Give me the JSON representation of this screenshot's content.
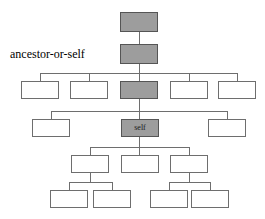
{
  "diagram": {
    "annotation": {
      "text": "ancestor-or-self",
      "x": 10,
      "y": 48
    },
    "colors": {
      "shaded_fill": "#9d9d9d",
      "plain_fill": "#ffffff",
      "border": "#6e6e6e",
      "shaded_border": "#555555",
      "edge": "#6e6e6e",
      "background": "#ffffff",
      "text": "#000000"
    },
    "legend": {
      "shaded_meaning": "ancestor-or-self",
      "self_node_label": "self"
    },
    "nodes": [
      {
        "id": "n1",
        "label": "",
        "shaded": true,
        "x": 120,
        "y": 12,
        "w": 38,
        "h": 20,
        "level": 1
      },
      {
        "id": "n2",
        "label": "",
        "shaded": true,
        "x": 120,
        "y": 44,
        "w": 38,
        "h": 20,
        "level": 2
      },
      {
        "id": "n3a",
        "label": "",
        "shaded": false,
        "x": 21,
        "y": 81,
        "w": 38,
        "h": 18,
        "level": 3
      },
      {
        "id": "n3b",
        "label": "",
        "shaded": false,
        "x": 70,
        "y": 81,
        "w": 38,
        "h": 18,
        "level": 3
      },
      {
        "id": "n3c",
        "label": "",
        "shaded": true,
        "x": 120,
        "y": 81,
        "w": 38,
        "h": 18,
        "level": 3
      },
      {
        "id": "n3d",
        "label": "",
        "shaded": false,
        "x": 170,
        "y": 81,
        "w": 38,
        "h": 18,
        "level": 3
      },
      {
        "id": "n3e",
        "label": "",
        "shaded": false,
        "x": 218,
        "y": 81,
        "w": 38,
        "h": 18,
        "level": 3
      },
      {
        "id": "n4a",
        "label": "",
        "shaded": false,
        "x": 32,
        "y": 119,
        "w": 38,
        "h": 18,
        "level": 4
      },
      {
        "id": "n4b",
        "label": "self",
        "shaded": true,
        "x": 121,
        "y": 119,
        "w": 38,
        "h": 18,
        "level": 4
      },
      {
        "id": "n4c",
        "label": "",
        "shaded": false,
        "x": 208,
        "y": 119,
        "w": 38,
        "h": 18,
        "level": 4
      },
      {
        "id": "n5a",
        "label": "",
        "shaded": false,
        "x": 71,
        "y": 155,
        "w": 38,
        "h": 18,
        "level": 5
      },
      {
        "id": "n5b",
        "label": "",
        "shaded": false,
        "x": 121,
        "y": 155,
        "w": 38,
        "h": 18,
        "level": 5
      },
      {
        "id": "n5c",
        "label": "",
        "shaded": false,
        "x": 170,
        "y": 155,
        "w": 38,
        "h": 18,
        "level": 5
      },
      {
        "id": "n6a",
        "label": "",
        "shaded": false,
        "x": 50,
        "y": 190,
        "w": 38,
        "h": 18,
        "level": 6
      },
      {
        "id": "n6b",
        "label": "",
        "shaded": false,
        "x": 93,
        "y": 190,
        "w": 38,
        "h": 18,
        "level": 6
      },
      {
        "id": "n6c",
        "label": "",
        "shaded": false,
        "x": 150,
        "y": 190,
        "w": 38,
        "h": 18,
        "level": 6
      },
      {
        "id": "n6d",
        "label": "",
        "shaded": false,
        "x": 191,
        "y": 190,
        "w": 38,
        "h": 18,
        "level": 6
      }
    ],
    "edges": [
      {
        "id": "e1",
        "orient": "v",
        "x": 139,
        "y": 32,
        "len": 12,
        "desc": "root-to-level2"
      },
      {
        "id": "e2",
        "orient": "v",
        "x": 139,
        "y": 64,
        "len": 17,
        "desc": "level2-to-bus3"
      },
      {
        "id": "e3",
        "orient": "h",
        "x": 40,
        "y": 73,
        "len": 198,
        "desc": "level3-bus"
      },
      {
        "id": "e4",
        "orient": "v",
        "x": 40,
        "y": 73,
        "len": 8,
        "desc": "drop-to-n3a"
      },
      {
        "id": "e5",
        "orient": "v",
        "x": 89,
        "y": 73,
        "len": 8,
        "desc": "drop-to-n3b"
      },
      {
        "id": "e6",
        "orient": "v",
        "x": 139,
        "y": 73,
        "len": 8,
        "desc": "drop-to-n3c"
      },
      {
        "id": "e7",
        "orient": "v",
        "x": 189,
        "y": 73,
        "len": 8,
        "desc": "drop-to-n3d"
      },
      {
        "id": "e8",
        "orient": "v",
        "x": 237,
        "y": 73,
        "len": 8,
        "desc": "drop-to-n3e"
      },
      {
        "id": "e9",
        "orient": "v",
        "x": 139,
        "y": 99,
        "len": 12,
        "desc": "n3c-to-bus4"
      },
      {
        "id": "e10",
        "orient": "h",
        "x": 51,
        "y": 111,
        "len": 176,
        "desc": "level4-bus"
      },
      {
        "id": "e11",
        "orient": "v",
        "x": 51,
        "y": 111,
        "len": 8,
        "desc": "drop-to-n4a"
      },
      {
        "id": "e12",
        "orient": "v",
        "x": 139,
        "y": 111,
        "len": 8,
        "desc": "drop-to-self"
      },
      {
        "id": "e13",
        "orient": "v",
        "x": 227,
        "y": 111,
        "len": 8,
        "desc": "drop-to-n4c"
      },
      {
        "id": "e14",
        "orient": "v",
        "x": 139,
        "y": 137,
        "len": 10,
        "desc": "self-to-bus5"
      },
      {
        "id": "e15",
        "orient": "h",
        "x": 90,
        "y": 147,
        "len": 99,
        "desc": "level5-bus"
      },
      {
        "id": "e16",
        "orient": "v",
        "x": 90,
        "y": 147,
        "len": 8,
        "desc": "drop-to-n5a"
      },
      {
        "id": "e17",
        "orient": "v",
        "x": 139,
        "y": 147,
        "len": 8,
        "desc": "drop-to-n5b"
      },
      {
        "id": "e18",
        "orient": "v",
        "x": 189,
        "y": 147,
        "len": 8,
        "desc": "drop-to-n5c"
      },
      {
        "id": "e19",
        "orient": "v",
        "x": 90,
        "y": 173,
        "len": 9,
        "desc": "n5a-to-bus6-left"
      },
      {
        "id": "e20",
        "orient": "h",
        "x": 69,
        "y": 182,
        "len": 43,
        "desc": "level6-bus-left"
      },
      {
        "id": "e21",
        "orient": "v",
        "x": 69,
        "y": 182,
        "len": 8,
        "desc": "drop-to-n6a"
      },
      {
        "id": "e22",
        "orient": "v",
        "x": 112,
        "y": 182,
        "len": 8,
        "desc": "drop-to-n6b"
      },
      {
        "id": "e23",
        "orient": "v",
        "x": 189,
        "y": 173,
        "len": 9,
        "desc": "n5c-to-bus6-right"
      },
      {
        "id": "e24",
        "orient": "h",
        "x": 169,
        "y": 182,
        "len": 41,
        "desc": "level6-bus-right"
      },
      {
        "id": "e25",
        "orient": "v",
        "x": 169,
        "y": 182,
        "len": 8,
        "desc": "drop-to-n6c"
      },
      {
        "id": "e26",
        "orient": "v",
        "x": 210,
        "y": 182,
        "len": 8,
        "desc": "drop-to-n6d"
      }
    ]
  }
}
